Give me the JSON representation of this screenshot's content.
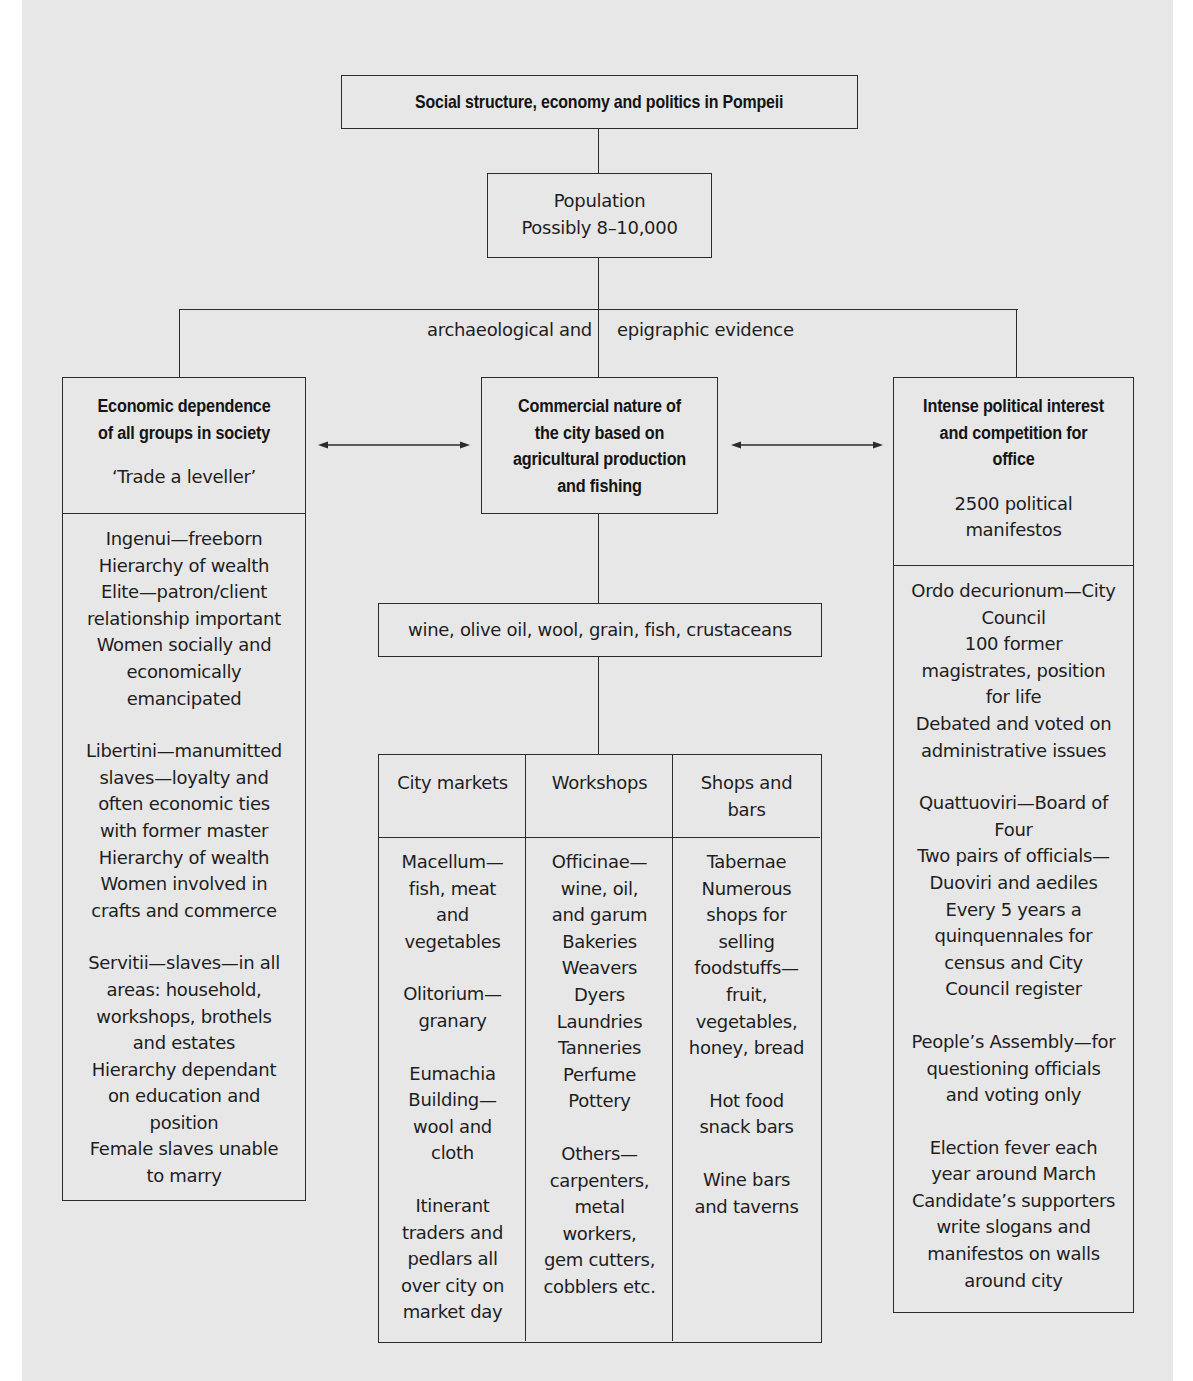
{
  "title": "Social structure, economy and politics in Pompeii",
  "population": {
    "label": "Population",
    "value": "Possibly 8–10,000"
  },
  "evidence": {
    "left": "archaeological and",
    "right": "epigraphic evidence"
  },
  "left_box": {
    "heading": "Economic dependence\nof all groups in society",
    "subheading": "‘Trade a leveller’",
    "sections": [
      "Ingenui—freeborn\nHierarchy of wealth\nElite—patron/client\nrelationship important\nWomen socially and\neconomically\nemancipated",
      "Libertini—manumitted\nslaves—loyalty and\noften economic ties\nwith former master\nHierarchy of wealth\nWomen involved in\ncrafts and commerce",
      "Servitii—slaves—in all\nareas: household,\nworkshops, brothels\nand estates\nHierarchy dependant\non education and\nposition\nFemale slaves unable\nto marry"
    ]
  },
  "center_box": {
    "heading": "Commercial nature of\nthe city based on\nagricultural production\nand fishing"
  },
  "products": "wine, olive oil, wool, grain, fish, crustaceans",
  "table": {
    "columns": [
      {
        "header": "City markets",
        "sections": [
          "Macellum—\nfish, meat\nand\nvegetables",
          "Olitorium—\ngranary",
          "Eumachia\nBuilding—\nwool and\ncloth",
          "Itinerant\ntraders and\npedlars all\nover city on\nmarket day"
        ]
      },
      {
        "header": "Workshops",
        "sections": [
          "Officinae—\nwine, oil,\nand garum\nBakeries\nWeavers\nDyers\nLaundries\nTanneries\nPerfume\nPottery",
          "Others—\ncarpenters,\nmetal\nworkers,\ngem cutters,\ncobblers etc."
        ]
      },
      {
        "header": "Shops and\nbars",
        "sections": [
          "Tabernae\nNumerous\nshops for\nselling\nfoodstuffs—\nfruit,\nvegetables,\nhoney, bread",
          "Hot food\nsnack bars",
          "Wine bars\nand taverns"
        ]
      }
    ]
  },
  "right_box": {
    "heading": "Intense political interest\nand competition for\noffice",
    "subheading": "2500 political\nmanifestos",
    "sections": [
      "Ordo decurionum—City\nCouncil\n100 former\nmagistrates, position\nfor life\nDebated and voted on\nadministrative issues",
      "Quattuoviri—Board of\nFour\nTwo pairs of officials—\nDuoviri and aediles\nEvery 5 years a\nquinquennales for\ncensus and City\nCouncil register",
      "People’s Assembly—for\nquestioning officials\nand voting only",
      "Election fever each\nyear around March\nCandidate’s supporters\nwrite slogans and\nmanifestos on walls\naround city"
    ]
  },
  "colors": {
    "background": "#e7e7e7",
    "margin": "#ffffff",
    "line": "#2b2b2b",
    "text": "#1c1c1c"
  }
}
